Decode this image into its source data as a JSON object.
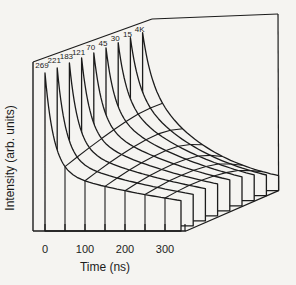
{
  "chart_data": {
    "type": "line",
    "subtype": "3d-waterfall-mesh",
    "title": "",
    "xlabel": "Time (ns)",
    "ylabel": "Intensity (arb. units)",
    "x_range": [
      0,
      340
    ],
    "x_ticks": [
      {
        "t": 0,
        "label": "0"
      },
      {
        "t": 100,
        "label": "100"
      },
      {
        "t": 200,
        "label": "200"
      },
      {
        "t": 300,
        "label": "300"
      }
    ],
    "x_minor_tick_step_ns": 50,
    "y_axis_note": "arbitrary units, no numeric scale shown",
    "temperature_labels": [
      "269",
      "221",
      "183",
      "121",
      "70",
      "45",
      "30",
      "15",
      "4K"
    ],
    "series": [
      {
        "label": "269",
        "fast_fraction": 0.62,
        "tau_slow_ns": 500
      },
      {
        "label": "221",
        "fast_fraction": 0.58,
        "tau_slow_ns": 460
      },
      {
        "label": "183",
        "fast_fraction": 0.54,
        "tau_slow_ns": 420
      },
      {
        "label": "121",
        "fast_fraction": 0.5,
        "tau_slow_ns": 375
      },
      {
        "label": "70",
        "fast_fraction": 0.46,
        "tau_slow_ns": 335
      },
      {
        "label": "45",
        "fast_fraction": 0.42,
        "tau_slow_ns": 295
      },
      {
        "label": "30",
        "fast_fraction": 0.38,
        "tau_slow_ns": 255
      },
      {
        "label": "15",
        "fast_fraction": 0.34,
        "tau_slow_ns": 210
      },
      {
        "label": "4K",
        "fast_fraction": 0.3,
        "tau_slow_ns": 170
      }
    ],
    "shared_model": {
      "peak": 1.0,
      "tau_fast_ns": 22
    },
    "iso_time_lines_ns": [
      50,
      100,
      150,
      200,
      250,
      300
    ],
    "layout": {
      "canvas": [
        296,
        285
      ],
      "origin": [
        45,
        231
      ],
      "px_per_ns": 0.4,
      "depth_step": [
        12.2,
        -5.05
      ],
      "peak_px": 158,
      "tick_len": 7,
      "frame": {
        "y_axis": [
          [
            33,
            231
          ],
          [
            33,
            62
          ]
        ],
        "x_axis": [
          [
            33,
            231
          ],
          [
            186,
            231
          ]
        ],
        "temp_edge": [
          [
            33,
            62
          ],
          [
            152,
            19
          ]
        ],
        "back_top_edge": [
          [
            152,
            19
          ],
          [
            278,
            14
          ]
        ],
        "right_edge": [
          [
            278,
            14
          ],
          [
            278.6,
            190.6
          ]
        ],
        "floor_edge": [
          [
            186,
            231
          ],
          [
            278.6,
            190.6
          ]
        ]
      },
      "colors": {
        "ink": "#1c1c1c",
        "paper": "#f5f4f1"
      }
    }
  }
}
